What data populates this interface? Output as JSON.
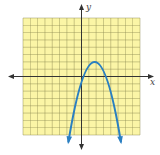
{
  "chart_data": {
    "type": "line",
    "title": "",
    "xlabel": "x",
    "ylabel": "y",
    "xlim": [
      -8,
      8
    ],
    "ylim": [
      -8,
      8
    ],
    "grid": true,
    "grid_step": 1,
    "tick_labels_shown": false,
    "series": [
      {
        "name": "parabola",
        "shape": "downward-opening parabola",
        "vertex": [
          1.8,
          2.0
        ],
        "x_intercepts_approx": [
          -0.5,
          4.2
        ],
        "arrows_at_ends": true,
        "endpoints_approx": [
          [
            -1.8,
            -9.0
          ],
          [
            5.4,
            -9.0
          ]
        ],
        "color": "#2a7fc1"
      }
    ],
    "colors": {
      "grid_fill": "#fbf5a6",
      "grid_line": "#8d8a52",
      "axis": "#333333",
      "curve": "#2a7fc1"
    }
  }
}
